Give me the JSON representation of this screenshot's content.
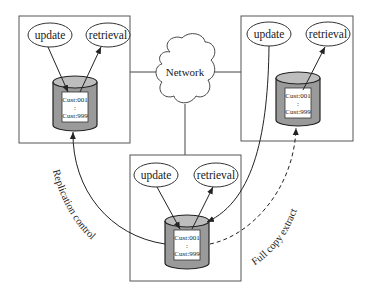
{
  "diagram": {
    "network": {
      "label": "Network"
    },
    "sites": [
      {
        "id": "left",
        "ellipses": {
          "update": "update",
          "retrieval": "retrieval"
        },
        "records": {
          "first": "Cust:001",
          "ellipsis": ":",
          "last": "Cust:999"
        }
      },
      {
        "id": "right",
        "ellipses": {
          "update": "update",
          "retrieval": "retrieval"
        },
        "records": {
          "first": "Cust:001",
          "ellipsis": ":",
          "last": "Cust:999"
        }
      },
      {
        "id": "bottom",
        "ellipses": {
          "update": "update",
          "retrieval": "retrieval"
        },
        "records": {
          "first": "Cust:001",
          "ellipsis": ":",
          "last": "Cust:999"
        }
      }
    ],
    "connections": {
      "replication": {
        "label": "Replication control",
        "style": "solid"
      },
      "full_copy": {
        "label": "Full copy extract",
        "style": "dashed"
      }
    },
    "colors": {
      "stroke": "#333333",
      "cylinder_fill": "#9a9a9a",
      "cylinder_top": "#bdbdbd",
      "box_fill": "#ffffff",
      "background": "#ffffff"
    }
  }
}
